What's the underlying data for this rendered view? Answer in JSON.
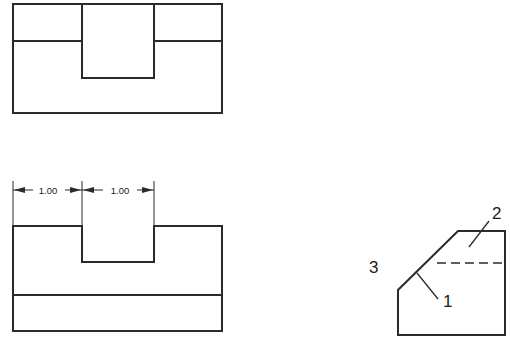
{
  "drawing": {
    "title": "Orthographic Views with Pictorial",
    "line_color": "#2b2b2b",
    "background_color": "#ffffff",
    "views": {
      "top": {
        "name": "top-view",
        "outline": "13,4 222,4 222,113 13,113",
        "slot_left_x": 82,
        "slot_right_x": 154,
        "slot_bottom_y": 78,
        "edge_line_y": 41
      },
      "front": {
        "name": "front-view",
        "outline_top_y": 226,
        "outline_bottom_y": 331,
        "left_x": 13,
        "right_x": 222,
        "notch_left_x": 82,
        "notch_right_x": 154,
        "notch_bottom_y": 262,
        "edge_line_y": 295
      },
      "pictorial": {
        "name": "pictorial-view",
        "bottom_left_x": 398,
        "bottom_y": 335,
        "right_x": 505,
        "chamfer_low_y": 290,
        "chamfer_top_x": 458,
        "chamfer_top_y": 231,
        "hidden_line_y": 263,
        "hidden_line_left_x": 437
      }
    },
    "dimensions": [
      {
        "id": "dim-left",
        "value": "1.00",
        "text_x": 48,
        "text_y": 194,
        "line_y": 190,
        "from_x": 13,
        "to_x": 82
      },
      {
        "id": "dim-right",
        "value": "1.00",
        "text_x": 120,
        "text_y": 194,
        "line_y": 190,
        "from_x": 82,
        "to_x": 154
      }
    ],
    "callouts": [
      {
        "id": "callout-1",
        "label": "1",
        "text_x": 443,
        "text_y": 307,
        "leader_from_x": 438,
        "leader_from_y": 299,
        "leader_to_x": 417,
        "leader_to_y": 273
      },
      {
        "id": "callout-2",
        "label": "2",
        "text_x": 492,
        "text_y": 219,
        "leader_from_x": 489,
        "leader_from_y": 221,
        "leader_to_x": 469,
        "leader_to_y": 247
      },
      {
        "id": "callout-3",
        "label": "3",
        "text_x": 369,
        "text_y": 273,
        "leader_from_x": 0,
        "leader_from_y": 0,
        "leader_to_x": 0,
        "leader_to_y": 0
      }
    ]
  }
}
